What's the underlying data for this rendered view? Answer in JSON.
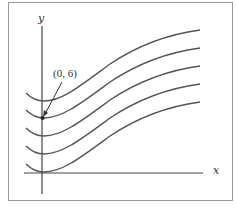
{
  "diagram": {
    "axes": {
      "x_label": "x",
      "y_label": "y"
    },
    "annotation": {
      "label": "(0, 6)",
      "point": [
        0,
        6
      ]
    },
    "curves": {
      "count": 5,
      "description": "Family of translated curves, each with a minimum on the y-axis, flattening to the left and rising to the right",
      "stroke_color": "#555555"
    },
    "colors": {
      "frame": "#9a9a9a",
      "axes": "#444444",
      "curves": "#555555"
    }
  }
}
